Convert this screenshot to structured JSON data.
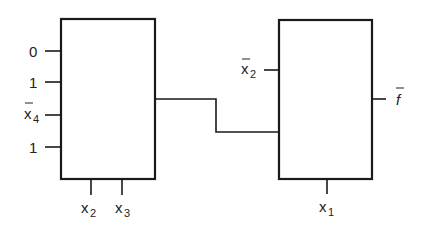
{
  "diagram": {
    "blocks": [
      {
        "id": "block-left",
        "inputs_left": [
          {
            "label": "0",
            "bar": false,
            "sub": ""
          },
          {
            "label": "1",
            "bar": false,
            "sub": ""
          },
          {
            "label": "x",
            "bar": true,
            "sub": "4"
          },
          {
            "label": "1",
            "bar": false,
            "sub": ""
          }
        ],
        "inputs_bottom": [
          {
            "label": "x",
            "sub": "2"
          },
          {
            "label": "x",
            "sub": "3"
          }
        ]
      },
      {
        "id": "block-right",
        "inputs_left": [
          {
            "label": "x",
            "bar": true,
            "sub": "2"
          }
        ],
        "inputs_bottom": [
          {
            "label": "x",
            "sub": "1"
          }
        ],
        "output": {
          "label": "f",
          "bar": true
        }
      }
    ],
    "connections": [
      {
        "from": "block-left.output",
        "to": "block-right.input-2"
      }
    ]
  }
}
